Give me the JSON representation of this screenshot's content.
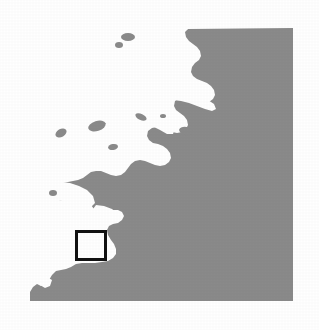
{
  "figure": {
    "type": "binary-landmask-map",
    "width": 319,
    "height": 330,
    "background_color": "#ffffff"
  },
  "legend_semantics": {
    "land_label": "Land",
    "land_color": "#8a8a8a",
    "water_label": "Water",
    "water_color": "#ffffff",
    "roi_label": "Study area",
    "roi_color": "#111111"
  },
  "map_extent": {
    "left": 30,
    "top": 28,
    "right": 293,
    "bottom": 301
  },
  "roi_box": {
    "name": "study-area-box",
    "x": 75,
    "y": 230,
    "width": 32,
    "height": 31,
    "stroke_color": "#111111",
    "stroke_width": 3,
    "fill": "none"
  },
  "geometry": {
    "land_outline_path": "M 293,28 L 293,301 L 30,301 L 30,290 L 33,285 L 38,283 L 42,285 L 46,283 L 50,279 L 53,274 L 57,271 L 62,270 L 67,269 L 72,266 L 77,263 L 82,262 L 88,262 L 94,262 L 100,262 L 106,261 L 111,259 L 114,255 L 115,250 L 113,245 L 110,241 L 107,236 L 106,231 L 108,227 L 112,225 L 117,224 L 121,221 L 123,217 L 121,213 L 117,211 L 112,211 L 107,213 L 102,214 L 97,213 L 93,210 L 90,206 L 87,202 L 83,199 L 78,198 L 73,199 L 68,201 L 63,202 L 58,201 L 54,198 L 52,194 L 53,189 L 57,186 L 62,184 L 67,183 L 72,182 L 77,181 L 82,179 L 86,176 L 90,173 L 95,172 L 100,172 L 105,174 L 110,176 L 115,177 L 120,176 L 124,173 L 127,169 L 130,165 L 134,162 L 139,161 L 144,162 L 149,164 L 154,166 L 159,167 L 164,166 L 168,163 L 170,159 L 169,154 L 166,150 L 162,147 L 157,145 L 152,144 L 148,141 L 146,137 L 147,132 L 151,129 L 156,128 L 161,129 L 166,131 L 171,133 L 176,134 L 181,133 L 185,130 L 187,126 L 186,121 L 183,117 L 179,114 L 175,111 L 173,107 L 174,102 L 178,99 L 183,98 L 188,99 L 193,101 L 198,103 L 203,104 L 208,103 L 212,100 L 214,96 L 213,91 L 210,87 L 206,84 L 201,82 L 196,80 L 192,77 L 190,73 L 191,68 L 194,64 L 198,61 L 200,57 L 199,52 L 196,48 L 192,45 L 188,42 L 185,38 L 184,33 L 186,29 L 190,28 Z",
    "water_shapes": [
      {
        "name": "northwest-inlet",
        "path": "M 186,28 L 181,31 L 176,34 L 171,36 L 166,37 L 161,38 L 156,40 L 152,43 L 149,47 L 148,52 L 150,57 L 154,60 L 159,62 L 164,63 L 169,64 L 173,67 L 175,71 L 174,76 L 171,80 L 167,83 L 162,85 L 157,86 L 152,86 L 147,85 L 142,83 L 137,81 L 132,80 L 127,81 L 123,84 L 121,88 L 122,93 L 125,97 L 129,100 L 133,103 L 135,107 L 134,112 L 131,116 L 127,119 L 122,121 L 117,122 L 112,122 L 107,121 L 103,118 L 101,114 L 102,109 L 105,105 L 109,102 L 112,98 L 113,93 L 111,88 L 107,85 L 102,83 L 97,82 L 93,79 L 91,75 L 92,70 L 95,66 L 99,63 L 103,60 L 106,56 L 107,51 L 106,46 L 104,41 L 103,36 L 105,31 L 110,29 Z"
      }
    ],
    "description": "Irregular fractal coastline: land mass occupies the right and lower portion of the frame; water (white) penetrates from the upper-left with deep fjord-like inlets, bays and several small offshore islands."
  },
  "features": {
    "islands": [
      {
        "name": "island-1",
        "cx": 128,
        "cy": 37,
        "rx": 7,
        "ry": 4
      },
      {
        "name": "island-2",
        "cx": 119,
        "cy": 44,
        "rx": 4,
        "ry": 3
      },
      {
        "name": "island-3",
        "cx": 163,
        "cy": 116,
        "rx": 3,
        "ry": 2
      },
      {
        "name": "island-4",
        "cx": 97,
        "cy": 126,
        "rx": 8,
        "ry": 5
      },
      {
        "name": "island-5",
        "cx": 140,
        "cy": 117,
        "rx": 5,
        "ry": 3
      },
      {
        "name": "island-6",
        "cx": 53,
        "cy": 193,
        "rx": 4,
        "ry": 3
      },
      {
        "name": "island-7",
        "cx": 60,
        "cy": 133,
        "rx": 5,
        "ry": 4
      },
      {
        "name": "island-8",
        "cx": 185,
        "cy": 131,
        "rx": 6,
        "ry": 4
      }
    ]
  }
}
